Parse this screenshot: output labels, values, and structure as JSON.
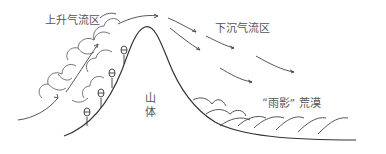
{
  "diagram": {
    "title": "",
    "labels": {
      "updraft_zone": "上升气流区",
      "downdraft_zone": "下沉气流区",
      "mountain_line1": "山",
      "mountain_line2": "体",
      "rain_shadow_desert": "“雨影” 荒漠"
    },
    "colors": {
      "line": "#333333",
      "text": "#555555",
      "cloud": "#666666",
      "background": "#ffffff"
    },
    "elements": {
      "mountain": "mountain-profile",
      "clouds": "orographic-clouds-windward",
      "trees_count": 4,
      "updraft_arrows_count": 4,
      "downdraft_arrows_count": 5,
      "dunes_count": 8
    }
  }
}
